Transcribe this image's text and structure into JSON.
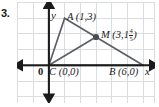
{
  "problem": {
    "number": "3."
  },
  "figure": {
    "type": "coordinate-plane-triangle",
    "axes": {
      "x_label": "x",
      "y_label": "y",
      "origin_label": "0",
      "x_range": [
        -2,
        7
      ],
      "y_range": [
        -2,
        5
      ],
      "grid": true,
      "grid_spacing": 1
    },
    "points": [
      {
        "id": "A",
        "name": "A",
        "coords_text": "(1,3)",
        "x": 1,
        "y": 3,
        "marker": false
      },
      {
        "id": "M",
        "name": "M",
        "coords_text": "(3,1",
        "x": 3,
        "y": 1.8,
        "marker": true,
        "mixed_whole": "1",
        "frac_num": "4",
        "frac_den": "5"
      },
      {
        "id": "C",
        "name": "C",
        "coords_text": "(0,0)",
        "x": 0,
        "y": 0,
        "marker": false
      },
      {
        "id": "B",
        "name": "B",
        "coords_text": "(6,0)",
        "x": 6,
        "y": 0,
        "marker": false
      }
    ],
    "segments": [
      {
        "from": "C",
        "to": "A"
      },
      {
        "from": "A",
        "to": "B"
      },
      {
        "from": "C",
        "to": "B"
      }
    ],
    "labels": {
      "A": "A (1,3)",
      "M_prefix": "M (3,1",
      "M_suffix": ")",
      "C": "C (0,0)",
      "B": "B (6,0)"
    },
    "colors": {
      "grid": "#d9dde0",
      "axis": "#1b1b1b",
      "segment": "#5c5f63",
      "marker": "#4a4d50",
      "text": "#1b1b1b",
      "background": "#ffffff"
    }
  }
}
